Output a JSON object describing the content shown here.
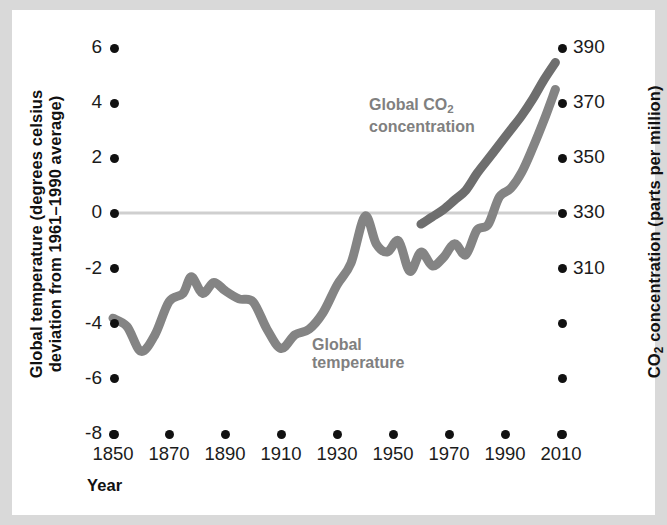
{
  "chart_data": {
    "type": "line",
    "title": "",
    "xlabel": "Year",
    "ylabel_left": "Global temperature (degrees celsius deviation from 1961–1990 average)",
    "ylabel_right": "CO₂ concentration (parts per million)",
    "grid": false,
    "legend_position": "inline-annotation",
    "x_ticks": [
      "1850",
      "1870",
      "1890",
      "1910",
      "1930",
      "1950",
      "1970",
      "1990",
      "2010"
    ],
    "xlim": [
      1850,
      2010
    ],
    "y_left_ticks": [
      "6",
      "4",
      "2",
      "0",
      "-2",
      "-4",
      "-6",
      "-8"
    ],
    "ylim_left": [
      -8,
      6
    ],
    "y_right_ticks": [
      "390",
      "370",
      "350",
      "330",
      "310",
      "",
      "",
      ""
    ],
    "ylim_right": [
      230,
      390
    ],
    "zero_line": 0,
    "series": [
      {
        "name": "Global temperature",
        "color": "#848484",
        "axis": "left",
        "label_text_line1": "Global",
        "label_text_line2": "temperature",
        "x": [
          1850,
          1855,
          1860,
          1865,
          1870,
          1875,
          1878,
          1882,
          1886,
          1890,
          1895,
          1900,
          1905,
          1910,
          1915,
          1920,
          1925,
          1930,
          1935,
          1940,
          1944,
          1948,
          1952,
          1956,
          1960,
          1964,
          1968,
          1972,
          1976,
          1980,
          1984,
          1988,
          1992,
          1996,
          2000,
          2004,
          2008
        ],
        "y": [
          -3.8,
          -4.1,
          -5.0,
          -4.4,
          -3.2,
          -2.9,
          -2.3,
          -2.9,
          -2.5,
          -2.8,
          -3.1,
          -3.2,
          -4.2,
          -4.9,
          -4.4,
          -4.2,
          -3.6,
          -2.6,
          -1.8,
          -0.1,
          -1.1,
          -1.4,
          -1.0,
          -2.1,
          -1.4,
          -1.9,
          -1.6,
          -1.1,
          -1.5,
          -0.6,
          -0.4,
          0.6,
          0.9,
          1.5,
          2.4,
          3.4,
          4.5
        ]
      },
      {
        "name": "Global CO2 concentration",
        "color": "#6e6e6e",
        "axis": "right",
        "label_text_line1": "Global CO₂",
        "label_text_line2": "concentration",
        "x": [
          1960,
          1964,
          1968,
          1972,
          1976,
          1980,
          1984,
          1988,
          1992,
          1996,
          2000,
          2004,
          2008
        ],
        "y": [
          317,
          320,
          323,
          327,
          331,
          338,
          344,
          350,
          356,
          362,
          369,
          377,
          384
        ]
      }
    ]
  },
  "axes": {
    "left_title": "Global temperature (degrees celsius",
    "left_title_line2": "deviation from 1961–1990 average)",
    "right_title_pre": "CO",
    "right_title_sub": "2",
    "right_title_post": " concentration (parts per million)",
    "x_title": "Year"
  },
  "colors": {
    "background": "#d9d9d9",
    "plate": "#ffffff",
    "temperature_line": "#848484",
    "co2_line": "#6e6e6e",
    "tick_dot": "#111111",
    "zero_line": "#cfcfcf",
    "label_gray": "#808080"
  }
}
